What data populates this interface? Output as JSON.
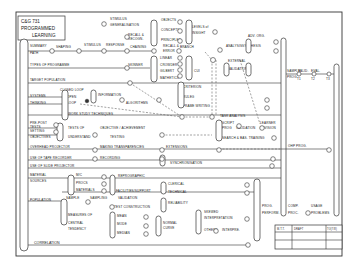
{
  "title_block": {
    "line1": "C&G 731",
    "line2": "PROGRAMMED",
    "line3": "LEARNING"
  },
  "rows": {
    "r1": "SUMMARY",
    "r1b": "PATH",
    "r1_mid": "SHAPING",
    "r1_stim": "STIMULUS",
    "r1_resp": "RESPONSE",
    "types": "TYPES OF PROGRAMME",
    "target": "TARGET POPULATION",
    "systems": "SYSTEMS",
    "thinking": "THINKING",
    "closed": "CLOSED LOOP",
    "open": "OPEN",
    "loop": "LOOP",
    "info": "INFORMATION",
    "algorithms": "ALGORITHMS",
    "work_study": "WORK STUDY TECHNIQUES",
    "pre_post": "PRE-POST",
    "tests": "TESTS",
    "setting": "SETTING",
    "objectives": "OBJECTIVES",
    "tests_of": "TESTS OF",
    "understand": "UNDERSTAND",
    "obj_ach": "OBJECTIVE / ACHIEVEMENT",
    "testing": "TESTING",
    "ohp": "OVERHEAD PROJECTOR",
    "making_tr": "MAKING TRANSPARENCIES",
    "ext": "EXTENSIONS",
    "tape": "USE OF TAPE RECORDER",
    "recording": "RECORDING",
    "slide": "USE OF SLIDE PROJECTOR",
    "sync": "SYNCHRONISATION",
    "material": "MATERIAL",
    "sources": "SOURCES",
    "mc": "M/C",
    "proc": "PROCS",
    "materials": "MATERIALS",
    "repro": "REPROGRAPHIC",
    "facilities": "FACILITIES/SUPPORT",
    "clerical": "CLERICAL",
    "technical": "TECHNICAL",
    "population": "POPULATION",
    "sample": "SAMPLE",
    "sampling": "SAMPLING",
    "validation": "VALIDATION",
    "test_constr": "TEST CONSTRUCTION",
    "reliability": "RELIABILITY",
    "measures": "MEASURES OF",
    "central": "CENTRAL",
    "tendency": "TENDENCY",
    "mean": "MEAN",
    "mode": "MODE",
    "median": "MEDIAN",
    "normal": "NORMAL",
    "curve": "CURVE",
    "skewed": "SKEWED",
    "interp": "INTERPRETATION",
    "others": "OTHERS",
    "interpre": "INTERPRE.",
    "correlation": "CORRELATION"
  },
  "top": {
    "stim_gen": "STIMULUS",
    "generation": "GENERALISATION",
    "recall": "RECALL &",
    "recog": "RECOGN.",
    "chaining": "CHAINING",
    "recall2": "RECALL &",
    "error": "ERROR",
    "skinner": "SKINNER",
    "crowder": "CROWDER",
    "gilbert": "GILBERT",
    "linear": "LINEAR",
    "branch": "BRANCH",
    "mathetics": "MATHETICS",
    "adaptive": "ADAPTIVE",
    "objects": "OBJECTS",
    "concepts": "CONCEPTS",
    "principles": "PRINCIPLES",
    "levels": "LEVELS of",
    "insight": "INSIGHT",
    "analysis": "ANALYSIS",
    "synthesis": "SYNTHESIS",
    "cui": "CUI",
    "criterion": "CRITERION",
    "rulag": "RULEG",
    "frame_writing": "FRAME WRITING",
    "task_analysis": "TASK ANALYSIS",
    "adv_org": "ADV. ORG.",
    "script": "SCRIPT",
    "prog": "PROG",
    "validation": "VALIDATION",
    "summary": "SUMMARY",
    "trial": "TRIAL",
    "learner": "LEARNER",
    "revision": "REVISION",
    "search": "SEARCH & BAS. TRAINING",
    "external": "EXTERNAL",
    "validation2": "VALIDATION"
  },
  "right": {
    "sample": "SAMPLE",
    "valid": "VALID.",
    "eval": "EVAL.",
    "prog": "PROG.",
    "t1": "T1",
    "t2": "T2",
    "t3": "T3",
    "ohp_prog": "OHP PROG.",
    "prog2": "PROG.",
    "perform": "PERFORM.",
    "comp": "COMP.",
    "proc": "PROC.",
    "usage": "USAGE",
    "problems": "PROBLEMS"
  },
  "table": {
    "c1": "M.T.T.",
    "c2": "DRAFT",
    "c3": "TO(7/8)"
  }
}
